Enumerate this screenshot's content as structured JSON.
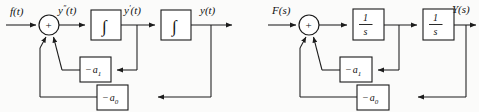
{
  "figure": {
    "type": "block-diagram-pair",
    "background_color": "#fbfbfa",
    "line_color": "#1c1c1c"
  },
  "left_diagram": {
    "name": "time-domain-simulation-diagram",
    "input_label": "f(t)",
    "summing_junction_sign": "+",
    "signal_after_sum": {
      "base": "y",
      "prime": "″",
      "arg": "(t)",
      "full": "y″(t)"
    },
    "block1_label": "∫",
    "signal_mid": {
      "base": "y",
      "prime": "′",
      "arg": "(t)",
      "full": "y′(t)"
    },
    "block2_label": "∫",
    "output_label": "y(t)",
    "feedback_inner": {
      "minus": "−",
      "coef": "a",
      "subscript": "1",
      "full": "− a₁"
    },
    "feedback_outer": {
      "minus": "−",
      "coef": "a",
      "subscript": "0",
      "full": "− a₀"
    }
  },
  "right_diagram": {
    "name": "laplace-domain-block-diagram",
    "input_label": "F(s)",
    "summing_junction_sign": "+",
    "block1": {
      "numerator": "1",
      "denominator": "s",
      "full": "1/s"
    },
    "block2": {
      "numerator": "1",
      "denominator": "s",
      "full": "1/s"
    },
    "output_label": "Y(s)",
    "feedback_inner": {
      "minus": "−",
      "coef": "a",
      "subscript": "1",
      "full": "− a₁"
    },
    "feedback_outer": {
      "minus": "−",
      "coef": "a",
      "subscript": "0",
      "full": "− a₀"
    }
  }
}
